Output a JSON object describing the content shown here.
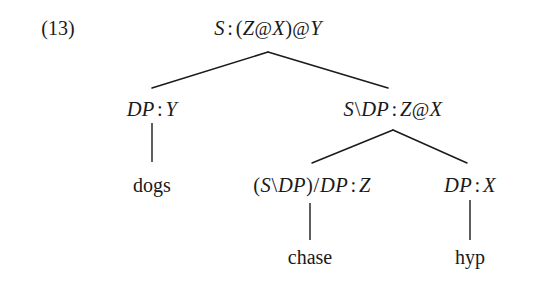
{
  "figure": {
    "example_number": "(13)",
    "caption": "",
    "background_color": "#ffffff",
    "ink_color": "#1a1a1a"
  },
  "tree": {
    "type": "ccg-derivation-tree",
    "nodes": [
      {
        "id": "root",
        "label": "S : (Z@X)@Y",
        "category": "S",
        "semantics": "(Z@X)@Y",
        "kind": "category",
        "x": 268,
        "y": 28
      },
      {
        "id": "subject",
        "label": "DP : Y",
        "category": "DP",
        "semantics": "Y",
        "kind": "category",
        "x": 152,
        "y": 109
      },
      {
        "id": "predicate",
        "label": "S\\DP : Z@X",
        "category": "S\\DP",
        "semantics": "Z@X",
        "kind": "category",
        "x": 393,
        "y": 109
      },
      {
        "id": "verb",
        "label": "(S\\DP)/DP : Z",
        "category": "(S\\DP)/DP",
        "semantics": "Z",
        "kind": "category",
        "x": 312,
        "y": 185
      },
      {
        "id": "object",
        "label": "DP : X",
        "category": "DP",
        "semantics": "X",
        "kind": "category",
        "x": 470,
        "y": 185
      },
      {
        "id": "word-dogs",
        "label": "dogs",
        "kind": "terminal",
        "x": 152,
        "y": 185
      },
      {
        "id": "word-chase",
        "label": "chase",
        "kind": "terminal",
        "x": 310,
        "y": 257
      },
      {
        "id": "word-hyp",
        "label": "hyp",
        "kind": "terminal",
        "x": 470,
        "y": 257
      }
    ],
    "edges": [
      {
        "from": "root",
        "to": "subject",
        "x1": 268,
        "y1": 52,
        "x2": 152,
        "y2": 88
      },
      {
        "from": "root",
        "to": "predicate",
        "x1": 268,
        "y1": 52,
        "x2": 388,
        "y2": 88
      },
      {
        "from": "subject",
        "to": "word-dogs",
        "x1": 152,
        "y1": 123,
        "x2": 152,
        "y2": 162
      },
      {
        "from": "predicate",
        "to": "verb",
        "x1": 393,
        "y1": 130,
        "x2": 312,
        "y2": 163
      },
      {
        "from": "predicate",
        "to": "object",
        "x1": 393,
        "y1": 130,
        "x2": 467,
        "y2": 163
      },
      {
        "from": "verb",
        "to": "word-chase",
        "x1": 310,
        "y1": 203,
        "x2": 310,
        "y2": 240
      },
      {
        "from": "object",
        "to": "word-hyp",
        "x1": 470,
        "y1": 200,
        "x2": 470,
        "y2": 240
      }
    ]
  },
  "labels": {
    "root_S": "S",
    "root_sem": "(Z@X)@Y",
    "subject_cat": "DP",
    "subject_sem": "Y",
    "predicate_cat": "S\\DP",
    "predicate_sem": "Z@X",
    "verb_cat": "(S\\DP)/DP",
    "verb_sem": "Z",
    "object_cat": "DP",
    "object_sem": "X",
    "word_dogs": "dogs",
    "word_chase": "chase",
    "word_hyp": "hyp",
    "colon": ":",
    "at": "@",
    "backslash": "\\",
    "forwardslash": "/",
    "lparen": "(",
    "rparen": ")"
  }
}
